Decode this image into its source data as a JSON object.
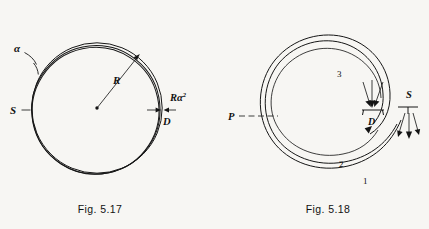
{
  "page": {
    "background": "#f7f6f3",
    "ink": "#161616",
    "kind": "textbook-figure-pair"
  },
  "figures": [
    {
      "id": "fig-5-17",
      "caption": "Fig. 5.17",
      "description": "Three overlapping circles of radius R all passing through source point S on the left and refocusing near detector D on the right; angular spread alpha; focal smearing R alpha squared.",
      "labels": {
        "alpha": "α",
        "radius": "R",
        "source": "S",
        "detector": "D",
        "spread": "Rα",
        "spread_exponent": "2"
      }
    },
    {
      "id": "fig-5-18",
      "caption": "Fig. 5.18",
      "description": "Spiral trajectories 1, 2 and 3 launched from source S travelling counter-clockwise around a circular orbit past point P and converging on detector D.",
      "labels": {
        "point_p": "P",
        "detector": "D",
        "source": "S",
        "trajectory_1": "1",
        "trajectory_2": "2",
        "trajectory_3": "3"
      }
    }
  ]
}
